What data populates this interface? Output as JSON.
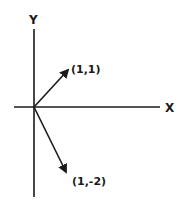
{
  "diagram": {
    "axes": {
      "x_label": "X",
      "y_label": "Y"
    },
    "vectors": [
      {
        "name": "vector-1-1",
        "label": "(1,1)",
        "components": [
          1,
          1
        ]
      },
      {
        "name": "vector-1-neg2",
        "label": "(1,-2)",
        "components": [
          1,
          -2
        ]
      }
    ],
    "colors": {
      "ink": "#1a1a1a",
      "background": "#ffffff"
    }
  }
}
